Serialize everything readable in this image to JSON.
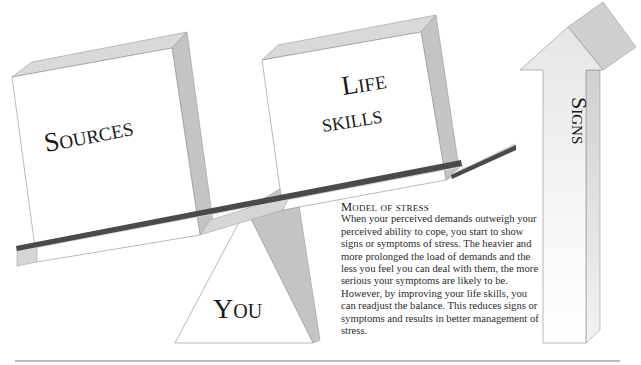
{
  "diagram": {
    "title": "Model of stress",
    "boxes": {
      "sources": {
        "label": "Sources"
      },
      "life_skills": {
        "label_line1": "Life",
        "label_line2": "skills"
      }
    },
    "fulcrum": {
      "label": "You"
    },
    "arrow": {
      "label": "Signs"
    },
    "caption": {
      "title": "Model of stress",
      "body": "When your perceived demands outweigh your perceived ability to cope, you start to show signs or symptoms of stress. The heavier and more prolonged the load of demands and the less you feel you can deal with them, the more serious your symptoms are likely to be. However, by improving your life skills, you can readjust the balance. This reduces signs or symptoms and results in better management of stress."
    },
    "colors": {
      "box_face": "#ffffff",
      "box_side": "#c4c4c4",
      "box_top": "#d9d9d9",
      "beam": "#4a4a4a",
      "outline": "#8a8a8a",
      "rule": "#bdbdbd",
      "text": "#1a1a1a"
    }
  }
}
